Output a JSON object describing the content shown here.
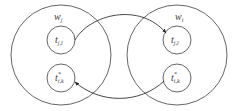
{
  "diagram": {
    "type": "set-mapping",
    "colors": {
      "stroke": "#444444",
      "background": "#ffffff",
      "text": "#3a3a3a"
    },
    "groups": [
      {
        "id": "left",
        "label_base": "w",
        "label_sub": "j",
        "nodes": [
          {
            "id": "left-top",
            "base": "t",
            "sup": "",
            "sub": "j,l"
          },
          {
            "id": "left-bottom",
            "base": "t",
            "sup": "*",
            "sub": "i,k"
          }
        ]
      },
      {
        "id": "right",
        "label_base": "w",
        "label_sub": "i",
        "nodes": [
          {
            "id": "right-top",
            "base": "t",
            "sup": "",
            "sub": "j,l"
          },
          {
            "id": "right-bottom",
            "base": "t",
            "sup": "*",
            "sub": "i,k"
          }
        ]
      }
    ],
    "edges": [
      {
        "from": "left-top",
        "to": "right-top",
        "style": "arc-over"
      },
      {
        "from": "right-bottom",
        "to": "left-bottom",
        "style": "arc-under"
      }
    ]
  }
}
